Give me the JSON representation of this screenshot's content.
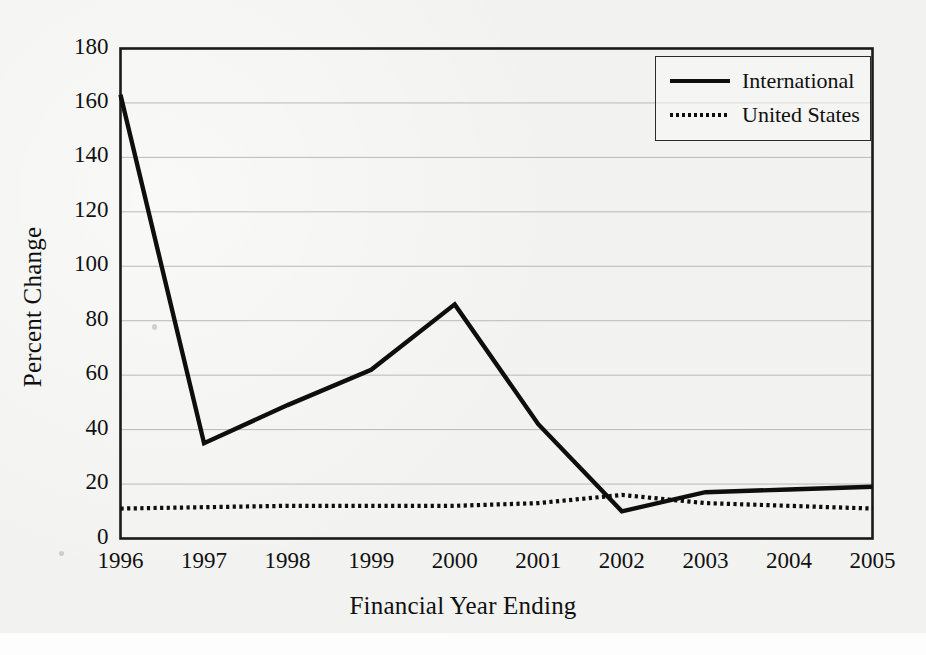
{
  "chart_data": {
    "type": "line",
    "title": "",
    "xlabel": "Financial Year Ending",
    "ylabel": "Percent Change",
    "categories": [
      "1996",
      "1997",
      "1998",
      "1999",
      "2000",
      "2001",
      "2002",
      "2003",
      "2004",
      "2005"
    ],
    "x": [
      1996,
      1997,
      1998,
      1999,
      2000,
      2001,
      2002,
      2003,
      2004,
      2005
    ],
    "xlim": [
      1996,
      2005
    ],
    "ylim": [
      0,
      180
    ],
    "ytick_values": [
      0,
      20,
      40,
      60,
      80,
      100,
      120,
      140,
      160,
      180
    ],
    "ytick_labels": [
      "0",
      "20",
      "40",
      "60",
      "80",
      "100",
      "120",
      "140",
      "160",
      "180"
    ],
    "grid": "horizontal",
    "legend_position": "top-right",
    "series": [
      {
        "name": "International",
        "style": "solid",
        "color": "#0e0e0e",
        "values": [
          163,
          35,
          49,
          62,
          86,
          42,
          10,
          17,
          18,
          19
        ]
      },
      {
        "name": "United States",
        "style": "dotted",
        "color": "#0e0e0e",
        "values": [
          11,
          11.5,
          12,
          12,
          12,
          13,
          16,
          13,
          12,
          11
        ]
      }
    ]
  },
  "axes": {
    "y_title": "Percent Change",
    "x_title": "Financial Year Ending"
  },
  "legend": {
    "entries": [
      {
        "label": "International",
        "style": "solid"
      },
      {
        "label": "United States",
        "style": "dotted"
      }
    ]
  }
}
